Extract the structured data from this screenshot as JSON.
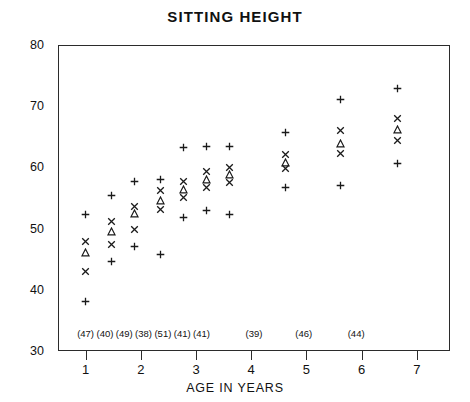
{
  "chart_data": {
    "type": "scatter",
    "title": "SITTING HEIGHT",
    "xlabel": "AGE IN YEARS",
    "ylabel": "",
    "xlim": [
      0.5,
      7.6
    ],
    "ylim": [
      30,
      80
    ],
    "ytick_labels": [
      "30",
      "40",
      "50",
      "60",
      "70",
      "80"
    ],
    "ytick_values": [
      30,
      40,
      50,
      60,
      70,
      80
    ],
    "xtick_labels": [
      "1",
      "2",
      "3",
      "4",
      "5",
      "6",
      "7"
    ],
    "xtick_values": [
      1,
      2,
      3,
      4,
      5,
      6,
      7
    ],
    "grid": false,
    "legend": "none",
    "marker_types": [
      "plus",
      "cross",
      "triangle"
    ],
    "sample_counts": [
      "(47)",
      "(40)",
      "(49)",
      "(38)",
      "(51)",
      "(41)",
      "(41)",
      "(39)",
      "(46)",
      "(44)"
    ],
    "sample_count_x": [
      1.0,
      1.35,
      1.7,
      2.05,
      2.4,
      2.75,
      3.1,
      4.05,
      4.95,
      5.9
    ],
    "groups": [
      {
        "x": 1.0,
        "n": "(47)",
        "max": 52.2,
        "sd_upper": 47.9,
        "mean": 46.1,
        "sd_lower": 42.9,
        "min": 38.0
      },
      {
        "x": 1.48,
        "n": "(40)",
        "max": 55.3,
        "sd_upper": 51.1,
        "mean": 49.4,
        "sd_lower": 47.4,
        "min": 44.5
      },
      {
        "x": 1.9,
        "n": "(49)",
        "max": 57.6,
        "sd_upper": 53.5,
        "mean": 52.4,
        "sd_lower": 49.8,
        "min": 47.0
      },
      {
        "x": 2.36,
        "n": "(38)",
        "max": 58.0,
        "sd_upper": 56.1,
        "mean": 54.6,
        "sd_lower": 53.0,
        "min": 45.7
      },
      {
        "x": 2.78,
        "n": "(51)",
        "max": 63.2,
        "sd_upper": 57.6,
        "mean": 56.3,
        "sd_lower": 55.0,
        "min": 51.7
      },
      {
        "x": 3.2,
        "n": "(41)",
        "max": 63.4,
        "sd_upper": 59.3,
        "mean": 57.9,
        "sd_lower": 56.6,
        "min": 52.9
      },
      {
        "x": 3.62,
        "n": "(41)",
        "max": 63.4,
        "sd_upper": 60.0,
        "mean": 58.8,
        "sd_lower": 57.5,
        "min": 52.2
      },
      {
        "x": 4.62,
        "n": "(39)",
        "max": 65.6,
        "sd_upper": 62.0,
        "mean": 60.7,
        "sd_lower": 59.7,
        "min": 56.6
      },
      {
        "x": 5.63,
        "n": "(46)",
        "max": 71.0,
        "sd_upper": 65.9,
        "mean": 63.8,
        "sd_lower": 62.2,
        "min": 57.0
      },
      {
        "x": 6.66,
        "n": "(44)",
        "max": 72.8,
        "sd_upper": 67.9,
        "mean": 66.1,
        "sd_lower": 64.3,
        "min": 60.6
      }
    ]
  },
  "colors": {
    "axis": "#2b2b2b",
    "marker": "#1a1a1a",
    "background": "#ffffff"
  }
}
